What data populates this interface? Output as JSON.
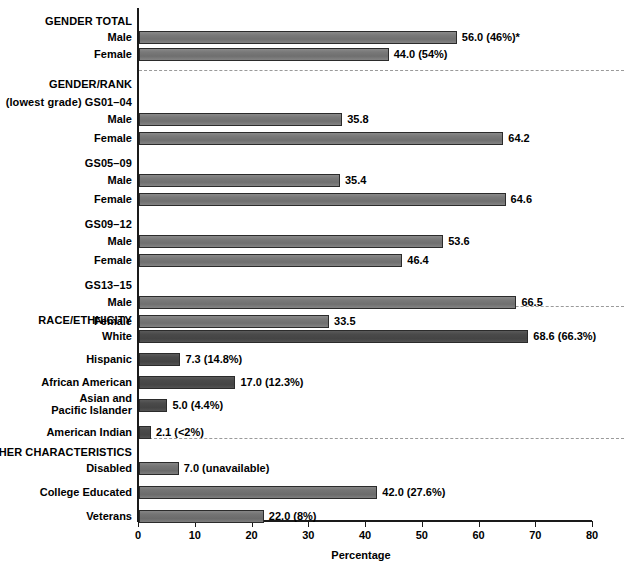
{
  "chart_data": {
    "type": "bar",
    "title": "",
    "xlabel": "Percentage",
    "ylabel": "",
    "xlim": [
      0,
      80
    ],
    "orientation": "horizontal",
    "grid": false,
    "legend": null,
    "xticks": [
      0,
      10,
      20,
      30,
      40,
      50,
      60,
      70,
      80
    ],
    "xticklabels": [
      "0",
      "10",
      "20",
      "30",
      "40",
      "50",
      "60",
      "70",
      "80"
    ],
    "sections": [
      {
        "heading": "GENDER TOTAL",
        "shade": "light",
        "rows": [
          {
            "label": "Male",
            "value": 56.0,
            "value_label": "56.0 (46%)*"
          },
          {
            "label": "Female",
            "value": 44.0,
            "value_label": "44.0 (54%)"
          }
        ]
      },
      {
        "heading": "GENDER/RANK",
        "shade": "light",
        "subgroups": [
          {
            "subheading": "(lowest grade) GS01–04",
            "rows": [
              {
                "label": "Male",
                "value": 35.8,
                "value_label": "35.8"
              },
              {
                "label": "Female",
                "value": 64.2,
                "value_label": "64.2"
              }
            ]
          },
          {
            "subheading": "GS05–09",
            "rows": [
              {
                "label": "Male",
                "value": 35.4,
                "value_label": "35.4"
              },
              {
                "label": "Female",
                "value": 64.6,
                "value_label": "64.6"
              }
            ]
          },
          {
            "subheading": "GS09–12",
            "rows": [
              {
                "label": "Male",
                "value": 53.6,
                "value_label": "53.6"
              },
              {
                "label": "Female",
                "value": 46.4,
                "value_label": "46.4"
              }
            ]
          },
          {
            "subheading": "GS13–15",
            "rows": [
              {
                "label": "Male",
                "value": 66.5,
                "value_label": "66.5"
              },
              {
                "label": "Female",
                "value": 33.5,
                "value_label": "33.5"
              }
            ]
          }
        ]
      },
      {
        "heading": "RACE/ETHNICITY",
        "shade": "dark",
        "rows": [
          {
            "label": "White",
            "value": 68.6,
            "value_label": "68.6 (66.3%)"
          },
          {
            "label": "Hispanic",
            "value": 7.3,
            "value_label": "7.3 (14.8%)"
          },
          {
            "label": "African American",
            "value": 17.0,
            "value_label": "17.0 (12.3%)"
          },
          {
            "label": "Asian and\nPacific Islander",
            "value": 5.0,
            "value_label": "5.0 (4.4%)"
          },
          {
            "label": "American Indian",
            "value": 2.1,
            "value_label": "2.1 (<2%)"
          }
        ]
      },
      {
        "heading": "OTHER CHARACTERISTICS",
        "shade": "mid",
        "rows": [
          {
            "label": "Disabled",
            "value": 7.0,
            "value_label": "7.0 (unavailable)"
          },
          {
            "label": "College Educated",
            "value": 42.0,
            "value_label": "42.0 (27.6%)"
          },
          {
            "label": "Veterans",
            "value": 22.0,
            "value_label": "22.0 (8%)"
          }
        ]
      }
    ]
  },
  "labels": {
    "gender_total": "GENDER TOTAL",
    "gender_rank": "GENDER/RANK",
    "race_ethnicity": "RACE/ETHNICITY",
    "other_characteristics": "OTHER CHARACTERISTICS",
    "male": "Male",
    "female": "Female",
    "gs01": "(lowest grade) GS01–04",
    "gs05": "GS05–09",
    "gs09": "GS09–12",
    "gs13": "GS13–15",
    "white": "White",
    "hispanic": "Hispanic",
    "african_american": "African American",
    "asian_line1": "Asian and",
    "asian_line2": "Pacific Islander",
    "american_indian": "American Indian",
    "disabled": "Disabled",
    "college_educated": "College Educated",
    "veterans": "Veterans",
    "percentage": "Percentage"
  },
  "colors": {
    "bar_light": "#757575",
    "bar_dark": "#474747",
    "bar_mid": "#707070",
    "axis": "#1a1a1a",
    "separator": "#9a9a9a",
    "text": "#000000",
    "background": "#ffffff"
  }
}
